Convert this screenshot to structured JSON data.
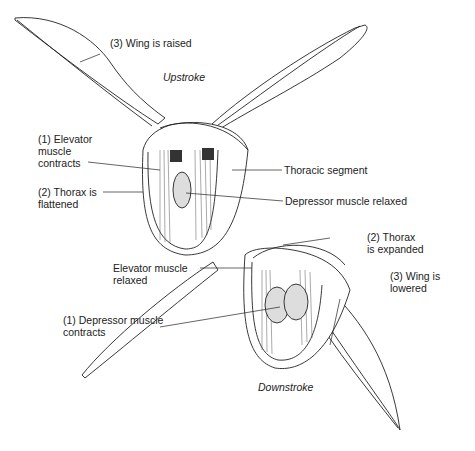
{
  "diagram": {
    "upstroke": {
      "caption": "Upstroke",
      "labels": {
        "wing": "(3) Wing is raised",
        "elevator_l1": "(1) Elevator",
        "elevator_l2": "muscle",
        "elevator_l3": "contracts",
        "thorax_l1": "(2) Thorax is",
        "thorax_l2": "flattened",
        "segment": "Thoracic segment",
        "depressor": "Depressor muscle relaxed"
      }
    },
    "downstroke": {
      "caption": "Downstroke",
      "labels": {
        "thorax_l1": "(2) Thorax",
        "thorax_l2": "is expanded",
        "elevator_l1": "Elevator muscle",
        "elevator_l2": "relaxed",
        "wing_l1": "(3) Wing is",
        "wing_l2": "lowered",
        "depressor_l1": "(1) Depressor muscle",
        "depressor_l2": "contracts"
      }
    },
    "colors": {
      "line": "#222222",
      "background": "#ffffff",
      "shade": "#555555"
    }
  }
}
